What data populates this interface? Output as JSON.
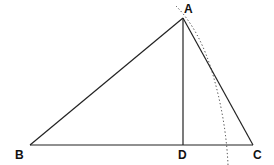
{
  "diagram": {
    "type": "geometry",
    "points": {
      "A": {
        "label": "A",
        "x": 183,
        "y": 18
      },
      "B": {
        "label": "B",
        "x": 30,
        "y": 145
      },
      "C": {
        "label": "C",
        "x": 253,
        "y": 145
      },
      "D": {
        "label": "D",
        "x": 183,
        "y": 145
      }
    },
    "segments": [
      "AB",
      "AC",
      "BC",
      "AD"
    ],
    "arc": {
      "style": "dotted",
      "description": "circular arc through A near side AC"
    },
    "line_color": "#222222"
  }
}
